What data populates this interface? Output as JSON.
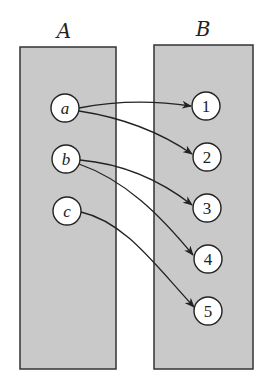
{
  "diagram": {
    "type": "function-mapping",
    "colors": {
      "set_fill": "#c9c9c9",
      "set_stroke": "#333333",
      "node_fill": "#ffffff",
      "edge": "#222222"
    },
    "sets": [
      {
        "id": "A",
        "label": "A",
        "x": 20,
        "y": 47,
        "w": 96,
        "h": 322,
        "label_x": 64,
        "label_y": 38
      },
      {
        "id": "B",
        "label": "B",
        "x": 154,
        "y": 45,
        "w": 99,
        "h": 324,
        "label_x": 203,
        "label_y": 36
      }
    ],
    "domain_nodes": [
      {
        "id": "a",
        "label": "a",
        "cx": 65,
        "cy": 108
      },
      {
        "id": "b",
        "label": "b",
        "cx": 66,
        "cy": 159
      },
      {
        "id": "c",
        "label": "c",
        "cx": 67,
        "cy": 211
      }
    ],
    "codomain_nodes": [
      {
        "id": "1",
        "label": "1",
        "cx": 206,
        "cy": 106
      },
      {
        "id": "2",
        "label": "2",
        "cx": 207,
        "cy": 157
      },
      {
        "id": "3",
        "label": "3",
        "cx": 207,
        "cy": 208
      },
      {
        "id": "4",
        "label": "4",
        "cx": 208,
        "cy": 259
      },
      {
        "id": "5",
        "label": "5",
        "cx": 208,
        "cy": 311
      }
    ],
    "edges": [
      {
        "from": "a",
        "to": "1"
      },
      {
        "from": "a",
        "to": "2"
      },
      {
        "from": "b",
        "to": "3"
      },
      {
        "from": "b",
        "to": "4"
      },
      {
        "from": "c",
        "to": "5"
      }
    ],
    "node_radius": 14
  }
}
